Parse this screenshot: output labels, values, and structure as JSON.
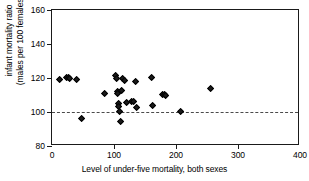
{
  "chart_data": {
    "type": "scatter",
    "title": "",
    "xlabel": "Level of under-five mortality, both sexes",
    "ylabel_line1": "infant mortality ratio",
    "ylabel_line2": "(males per 100 females)",
    "xlim": [
      0,
      400
    ],
    "ylim": [
      80,
      160
    ],
    "xticks": [
      0,
      100,
      200,
      300,
      400
    ],
    "yticks": [
      80,
      100,
      120,
      140,
      160
    ],
    "grid": false,
    "legend": null,
    "reference_line": {
      "orientation": "horizontal",
      "value": 100,
      "style": "dashed",
      "color": "#4a4a4a"
    },
    "marker": {
      "shape": "diamond",
      "color": "#1a1a1a",
      "size": 5
    },
    "points": [
      {
        "x": 12,
        "y": 119
      },
      {
        "x": 24,
        "y": 120
      },
      {
        "x": 27,
        "y": 120
      },
      {
        "x": 28,
        "y": 119.5
      },
      {
        "x": 40,
        "y": 119
      },
      {
        "x": 47,
        "y": 96
      },
      {
        "x": 85,
        "y": 111
      },
      {
        "x": 103,
        "y": 121.5
      },
      {
        "x": 104,
        "y": 119.5
      },
      {
        "x": 105,
        "y": 112
      },
      {
        "x": 106,
        "y": 111
      },
      {
        "x": 107,
        "y": 105
      },
      {
        "x": 108,
        "y": 103
      },
      {
        "x": 109,
        "y": 100.5
      },
      {
        "x": 110,
        "y": 94.5
      },
      {
        "x": 112,
        "y": 112.5
      },
      {
        "x": 114,
        "y": 119.5
      },
      {
        "x": 117,
        "y": 118.5
      },
      {
        "x": 121,
        "y": 105.5
      },
      {
        "x": 128,
        "y": 106
      },
      {
        "x": 132,
        "y": 106
      },
      {
        "x": 135,
        "y": 118
      },
      {
        "x": 137,
        "y": 102.5
      },
      {
        "x": 160,
        "y": 120.5
      },
      {
        "x": 162,
        "y": 104
      },
      {
        "x": 178,
        "y": 110
      },
      {
        "x": 181,
        "y": 110
      },
      {
        "x": 184,
        "y": 109.5
      },
      {
        "x": 207,
        "y": 100.5
      },
      {
        "x": 255,
        "y": 113.5
      }
    ]
  }
}
